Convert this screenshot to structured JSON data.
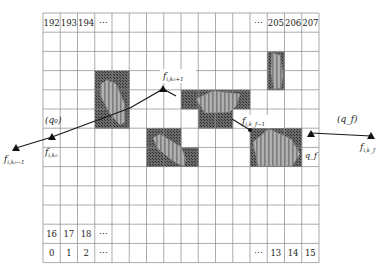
{
  "grid": {
    "left": 43,
    "top": 13,
    "cols": 16,
    "rows": 13,
    "cell_w": 17.25,
    "cell_h": 19.2,
    "line_color": "#888888",
    "top_row_labels": [
      {
        "col": 0,
        "text": "192"
      },
      {
        "col": 1,
        "text": "193"
      },
      {
        "col": 2,
        "text": "194"
      },
      {
        "col": 3,
        "text": "⋯"
      },
      {
        "col": 12,
        "text": "⋯"
      },
      {
        "col": 13,
        "text": "205"
      },
      {
        "col": 14,
        "text": "206"
      },
      {
        "col": 15,
        "text": "207"
      }
    ],
    "second_last_row_labels": [
      {
        "col": 0,
        "text": "16"
      },
      {
        "col": 1,
        "text": "17"
      },
      {
        "col": 2,
        "text": "18"
      },
      {
        "col": 3,
        "text": "⋯"
      }
    ],
    "bottom_row_labels": [
      {
        "col": 0,
        "text": "0"
      },
      {
        "col": 1,
        "text": "1"
      },
      {
        "col": 2,
        "text": "2"
      },
      {
        "col": 3,
        "text": "⋯"
      },
      {
        "col": 12,
        "text": "⋯"
      },
      {
        "col": 13,
        "text": "13"
      },
      {
        "col": 14,
        "text": "14"
      },
      {
        "col": 15,
        "text": "15"
      }
    ]
  },
  "obstacles": [
    {
      "name": "obstacle-1",
      "cells": [
        [
          3,
          3
        ],
        [
          4,
          3
        ],
        [
          3,
          4
        ],
        [
          4,
          4
        ],
        [
          3,
          5
        ],
        [
          4,
          5
        ]
      ],
      "polygon": "107,80 116,84 125,105 125,122 120,125 110,114 100,95 101,84"
    },
    {
      "name": "obstacle-2",
      "cells": [
        [
          6,
          6
        ],
        [
          7,
          6
        ],
        [
          6,
          7
        ],
        [
          7,
          7
        ],
        [
          8,
          7
        ]
      ],
      "polygon": "153,138 160,134 181,147 186,159 184,166 176,163 158,149"
    },
    {
      "name": "obstacle-3",
      "cells": [
        [
          8,
          4
        ],
        [
          9,
          4
        ],
        [
          10,
          4
        ],
        [
          11,
          4
        ],
        [
          9,
          5
        ],
        [
          10,
          5
        ]
      ],
      "polygon": "196,99 213,91 240,94 236,106 230,112 205,113"
    },
    {
      "name": "obstacle-4",
      "cells": [
        [
          12,
          6
        ],
        [
          13,
          6
        ],
        [
          14,
          6
        ],
        [
          12,
          7
        ],
        [
          13,
          7
        ],
        [
          14,
          7
        ]
      ],
      "polygon": "253,142 269,129 291,139 300,154 292,166 258,166"
    },
    {
      "name": "obstacle-5",
      "cells": [
        [
          13,
          2
        ],
        [
          13,
          3
        ]
      ],
      "polygon": "272,53 280,55 283,75 281,88 274,89 271,73"
    }
  ],
  "colors": {
    "obstacle_fill": "#5a5a5a",
    "obstacle_hatch": "#3a3a3a",
    "polygon_fill": "#a8a8a8",
    "polygon_stripe": "#7a7a7a",
    "path": "#1a1a1a"
  },
  "labels": {
    "q0": "(q₀)",
    "qf": "(q_f)",
    "qf_cell": "q_f",
    "f_k0_minus1": "f",
    "f_k0_minus1_sub": "i,k₀−1",
    "f_k0": "f",
    "f_k0_sub": "i,k₀",
    "f_k0_plus1": "f",
    "f_k0_plus1_sub": "i,k₀+1",
    "f_kf_minus1": "f",
    "f_kf_minus1_sub": "i,k_f−1",
    "f_kf": "f",
    "f_kf_sub": "i,k_f"
  },
  "path": {
    "points": [
      [
        16,
        148
      ],
      [
        52,
        137
      ],
      [
        130,
        108
      ],
      [
        163,
        89
      ],
      [
        176,
        96
      ]
    ],
    "segment2": [
      [
        232,
        119
      ],
      [
        250,
        130
      ]
    ],
    "segment3": [
      [
        311,
        133
      ],
      [
        371,
        136
      ]
    ]
  }
}
